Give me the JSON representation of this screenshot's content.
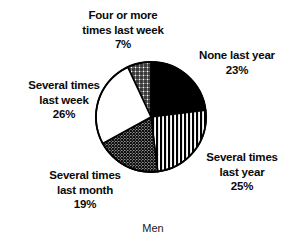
{
  "chart_data": {
    "type": "pie",
    "title": "",
    "caption": "Men",
    "xlabel": "",
    "ylabel": "",
    "legend_position": "none",
    "grid": false,
    "unit": "%",
    "total": 100,
    "start_angle_deg": -25,
    "direction": "clockwise",
    "center": {
      "x": 151,
      "y": 117
    },
    "radius": 55,
    "categories": [
      "Four or more times last week",
      "None last year",
      "Several times last year",
      "Several times last month",
      "Several times last week"
    ],
    "values": [
      7,
      23,
      25,
      19,
      26
    ],
    "slices": [
      {
        "id": "four-or-more-last-week",
        "label_lines": [
          "Four or more",
          "times last week"
        ],
        "value": 7,
        "value_text": "7%",
        "fill": "crosshatch",
        "fill_color": "#000000",
        "background": "#ffffff"
      },
      {
        "id": "none-last-year",
        "label_lines": [
          "None last year"
        ],
        "value": 23,
        "value_text": "23%",
        "fill": "solid",
        "fill_color": "#000000",
        "background": "#000000"
      },
      {
        "id": "several-times-last-year",
        "label_lines": [
          "Several times",
          "last year"
        ],
        "value": 25,
        "value_text": "25%",
        "fill": "vertical-stripes",
        "fill_color": "#000000",
        "background": "#ffffff"
      },
      {
        "id": "several-times-last-month",
        "label_lines": [
          "Several times",
          "last month"
        ],
        "value": 19,
        "value_text": "19%",
        "fill": "dense-stipple",
        "fill_color": "#000000",
        "background": "#1a1a1a"
      },
      {
        "id": "several-times-last-week",
        "label_lines": [
          "Several times",
          "last week"
        ],
        "value": 26,
        "value_text": "26%",
        "fill": "none",
        "fill_color": "#ffffff",
        "background": "#ffffff"
      }
    ]
  },
  "labels": {
    "four_or_more": {
      "line1": "Four or more",
      "line2": "times last week",
      "value": "7%"
    },
    "none_last_year": {
      "line1": "None last year",
      "value": "23%"
    },
    "several_last_year": {
      "line1": "Several times",
      "line2": "last year",
      "value": "25%"
    },
    "several_last_week": {
      "line1": "Several times",
      "line2": "last week",
      "value": "26%"
    },
    "several_last_month": {
      "line1": "Several times",
      "line2": "last month",
      "value": "19%"
    }
  },
  "caption": {
    "text": "Men"
  },
  "colors": {
    "ink": "#000000",
    "paper": "#ffffff"
  }
}
